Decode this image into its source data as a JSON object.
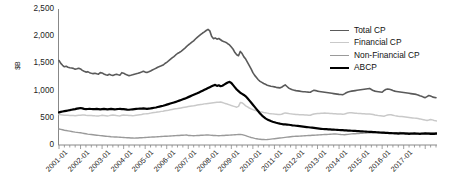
{
  "chart_data": {
    "type": "line",
    "title": "",
    "xlabel": "",
    "ylabel": "$B",
    "ylim": [
      0,
      2500
    ],
    "yticks": [
      "0",
      "500",
      "1,000",
      "1,500",
      "2,000",
      "2,500"
    ],
    "ytick_values": [
      0,
      500,
      1000,
      1500,
      2000,
      2500
    ],
    "grid": false,
    "legend_position": "top-right",
    "x_start": "2001-01",
    "x_end": "2017-07",
    "x_interval": "monthly",
    "xticks": [
      "2001-01",
      "2002-01",
      "2003-01",
      "2004-01",
      "2005-01",
      "2006-01",
      "2007-01",
      "2008-01",
      "2009-01",
      "2010-01",
      "2011-01",
      "2012-01",
      "2013-01",
      "2014-01",
      "2015-01",
      "2016-01",
      "2017-01"
    ],
    "series": [
      {
        "name": "Total CP",
        "color": "#5a5a5a",
        "width": 1.6,
        "values": [
          1553,
          1500,
          1465,
          1438,
          1448,
          1430,
          1420,
          1415,
          1408,
          1392,
          1400,
          1412,
          1398,
          1372,
          1355,
          1340,
          1348,
          1330,
          1318,
          1312,
          1320,
          1310,
          1302,
          1330,
          1325,
          1305,
          1290,
          1282,
          1300,
          1288,
          1278,
          1290,
          1300,
          1292,
          1285,
          1330,
          1320,
          1300,
          1288,
          1275,
          1282,
          1290,
          1302,
          1310,
          1318,
          1330,
          1342,
          1355,
          1340,
          1332,
          1345,
          1360,
          1378,
          1395,
          1410,
          1428,
          1442,
          1455,
          1470,
          1498,
          1520,
          1545,
          1572,
          1600,
          1625,
          1655,
          1682,
          1700,
          1722,
          1748,
          1775,
          1808,
          1838,
          1862,
          1890,
          1915,
          1948,
          1978,
          2005,
          2032,
          2058,
          2080,
          2105,
          2125,
          2098,
          2000,
          1955,
          1968,
          1945,
          1958,
          1935,
          1912,
          1900,
          1885,
          1862,
          1840,
          1800,
          1760,
          1700,
          1660,
          1640,
          1720,
          1680,
          1620,
          1580,
          1520,
          1460,
          1400,
          1330,
          1280,
          1240,
          1200,
          1170,
          1150,
          1130,
          1115,
          1100,
          1090,
          1080,
          1075,
          1068,
          1060,
          1055,
          1050,
          1060,
          1085,
          1105,
          1075,
          1045,
          1028,
          1015,
          1008,
          1000,
          995,
          990,
          985,
          980,
          978,
          975,
          972,
          970,
          990,
          1005,
          1000,
          990,
          985,
          980,
          975,
          970,
          965,
          960,
          955,
          950,
          945,
          940,
          935,
          930,
          928,
          925,
          940,
          960,
          975,
          985,
          990,
          995,
          1000,
          1005,
          1010,
          1015,
          1020,
          1025,
          1030,
          1035,
          1040,
          1020,
          1000,
          990,
          985,
          980,
          975,
          970,
          1000,
          1020,
          1030,
          1025,
          1015,
          1000,
          990,
          985,
          980,
          975,
          970,
          965,
          960,
          955,
          950,
          945,
          940,
          935,
          930,
          920,
          905,
          895,
          880,
          870,
          890,
          910,
          900,
          885,
          875,
          870
        ]
      },
      {
        "name": "Financial CP",
        "color": "#c9c9c9",
        "width": 1.5,
        "values": [
          560,
          556,
          552,
          548,
          546,
          545,
          544,
          542,
          540,
          538,
          542,
          546,
          548,
          552,
          550,
          546,
          544,
          542,
          540,
          538,
          536,
          535,
          534,
          540,
          545,
          542,
          538,
          535,
          540,
          548,
          552,
          548,
          542,
          538,
          535,
          548,
          552,
          548,
          545,
          542,
          540,
          538,
          542,
          548,
          552,
          556,
          560,
          568,
          572,
          576,
          580,
          586,
          592,
          598,
          602,
          608,
          612,
          618,
          622,
          628,
          634,
          640,
          648,
          654,
          660,
          665,
          670,
          676,
          682,
          688,
          694,
          700,
          706,
          712,
          718,
          722,
          728,
          734,
          740,
          746,
          750,
          756,
          760,
          764,
          768,
          772,
          776,
          780,
          784,
          788,
          790,
          780,
          770,
          760,
          748,
          738,
          725,
          715,
          705,
          695,
          710,
          780,
          775,
          750,
          720,
          700,
          680,
          665,
          650,
          640,
          630,
          620,
          612,
          605,
          598,
          592,
          586,
          580,
          576,
          572,
          568,
          565,
          562,
          560,
          565,
          580,
          590,
          585,
          578,
          572,
          568,
          565,
          562,
          560,
          558,
          556,
          554,
          552,
          550,
          548,
          546,
          560,
          570,
          575,
          578,
          580,
          582,
          584,
          586,
          584,
          582,
          580,
          578,
          576,
          574,
          572,
          570,
          568,
          566,
          570,
          580,
          590,
          595,
          592,
          588,
          585,
          582,
          580,
          578,
          576,
          574,
          572,
          570,
          568,
          566,
          560,
          550,
          545,
          540,
          536,
          532,
          528,
          540,
          552,
          558,
          554,
          548,
          540,
          535,
          530,
          526,
          522,
          518,
          514,
          510,
          506,
          502,
          498,
          494,
          490,
          486,
          480,
          472,
          465,
          458,
          452,
          460,
          470,
          462,
          452,
          445,
          440
        ]
      },
      {
        "name": "Non-Financial CP",
        "color": "#9a9a9a",
        "width": 1.4,
        "values": [
          295,
          288,
          280,
          272,
          266,
          260,
          254,
          248,
          242,
          236,
          232,
          228,
          224,
          218,
          212,
          206,
          200,
          196,
          192,
          188,
          184,
          180,
          176,
          172,
          170,
          166,
          162,
          158,
          156,
          152,
          150,
          148,
          146,
          144,
          142,
          140,
          138,
          136,
          134,
          132,
          130,
          128,
          126,
          128,
          130,
          132,
          134,
          136,
          138,
          140,
          142,
          144,
          146,
          148,
          150,
          152,
          154,
          156,
          158,
          160,
          162,
          164,
          166,
          168,
          170,
          172,
          174,
          176,
          178,
          180,
          182,
          184,
          176,
          174,
          172,
          170,
          172,
          174,
          176,
          178,
          180,
          182,
          184,
          186,
          182,
          178,
          176,
          174,
          172,
          170,
          172,
          174,
          176,
          178,
          180,
          182,
          184,
          186,
          188,
          190,
          192,
          194,
          190,
          182,
          172,
          160,
          148,
          138,
          130,
          122,
          116,
          110,
          106,
          102,
          100,
          98,
          100,
          104,
          108,
          112,
          116,
          120,
          124,
          128,
          132,
          136,
          140,
          144,
          148,
          152,
          156,
          158,
          160,
          162,
          164,
          166,
          168,
          170,
          172,
          174,
          176,
          178,
          180,
          182,
          184,
          186,
          188,
          190,
          192,
          194,
          196,
          198,
          200,
          202,
          204,
          200,
          196,
          192,
          190,
          188,
          192,
          196,
          200,
          204,
          206,
          208,
          210,
          212,
          214,
          216,
          218,
          220,
          222,
          224,
          226,
          228,
          230,
          226,
          222,
          220,
          218,
          216,
          214,
          216,
          218,
          220,
          222,
          224,
          226,
          228,
          230,
          228,
          226,
          224,
          222,
          220,
          218,
          216,
          214,
          212,
          210,
          212,
          214,
          216,
          218,
          220,
          222,
          224,
          226,
          228,
          226,
          224,
          222,
          220,
          222
        ]
      },
      {
        "name": "ABCP",
        "color": "#000000",
        "width": 2.2,
        "values": [
          600,
          608,
          616,
          622,
          628,
          634,
          640,
          648,
          654,
          660,
          668,
          674,
          680,
          672,
          664,
          658,
          662,
          666,
          662,
          658,
          660,
          664,
          660,
          656,
          660,
          664,
          660,
          656,
          660,
          664,
          660,
          656,
          658,
          662,
          664,
          660,
          658,
          654,
          650,
          648,
          652,
          656,
          660,
          664,
          666,
          668,
          670,
          672,
          668,
          664,
          668,
          672,
          678,
          684,
          690,
          698,
          706,
          714,
          722,
          732,
          742,
          752,
          762,
          772,
          782,
          792,
          804,
          816,
          828,
          840,
          852,
          866,
          880,
          894,
          908,
          922,
          936,
          950,
          966,
          982,
          998,
          1014,
          1030,
          1046,
          1062,
          1078,
          1094,
          1105,
          1086,
          1098,
          1080,
          1090,
          1110,
          1130,
          1150,
          1160,
          1140,
          1100,
          1060,
          1020,
          990,
          960,
          940,
          920,
          895,
          860,
          820,
          780,
          740,
          700,
          660,
          620,
          580,
          545,
          515,
          490,
          470,
          455,
          440,
          428,
          418,
          408,
          400,
          392,
          386,
          380,
          378,
          376,
          372,
          368,
          362,
          358,
          354,
          350,
          346,
          342,
          338,
          334,
          330,
          326,
          322,
          318,
          314,
          310,
          306,
          302,
          298,
          294,
          292,
          290,
          288,
          286,
          284,
          282,
          280,
          278,
          276,
          274,
          272,
          270,
          268,
          266,
          264,
          262,
          260,
          258,
          256,
          254,
          252,
          250,
          248,
          246,
          244,
          242,
          240,
          238,
          236,
          234,
          232,
          230,
          228,
          226,
          224,
          222,
          220,
          218,
          216,
          214,
          212,
          210,
          212,
          214,
          212,
          210,
          208,
          206,
          208,
          210,
          212,
          210,
          208,
          206,
          208,
          210,
          212,
          210,
          208,
          206,
          204,
          206,
          208,
          210,
          212,
          210,
          208,
          206,
          204,
          206
        ]
      }
    ]
  },
  "legend": {
    "items": [
      {
        "label": "Total CP"
      },
      {
        "label": "Financial CP"
      },
      {
        "label": "Non-Financial CP"
      },
      {
        "label": "ABCP"
      }
    ]
  },
  "axes": {
    "y_axis_title": "$B"
  }
}
